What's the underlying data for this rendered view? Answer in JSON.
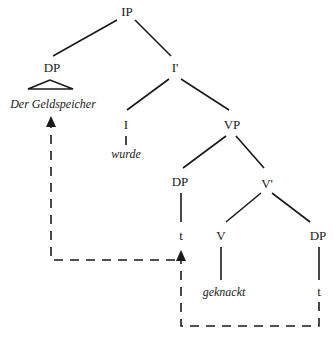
{
  "diagram": {
    "type": "syntax-tree",
    "nodes": {
      "ip": "IP",
      "dp_subject": "DP",
      "dp_subject_word": "Der Geldspeicher",
      "i_bar": "I'",
      "i": "I",
      "i_word": "wurde",
      "vp": "VP",
      "dp_spec_vp": "DP",
      "dp_spec_vp_trace": "t",
      "v_bar": "V'",
      "v": "V",
      "v_word": "geknackt",
      "dp_object": "DP",
      "dp_object_trace": "t"
    },
    "movements": [
      {
        "from": "dp_object_trace",
        "to": "dp_spec_vp_trace",
        "style": "dashed-arrow"
      },
      {
        "from": "dp_spec_vp_trace",
        "to": "dp_subject_word",
        "style": "dashed-arrow"
      }
    ],
    "colors": {
      "ink": "#1a1a1a",
      "background": "#ffffff"
    }
  }
}
